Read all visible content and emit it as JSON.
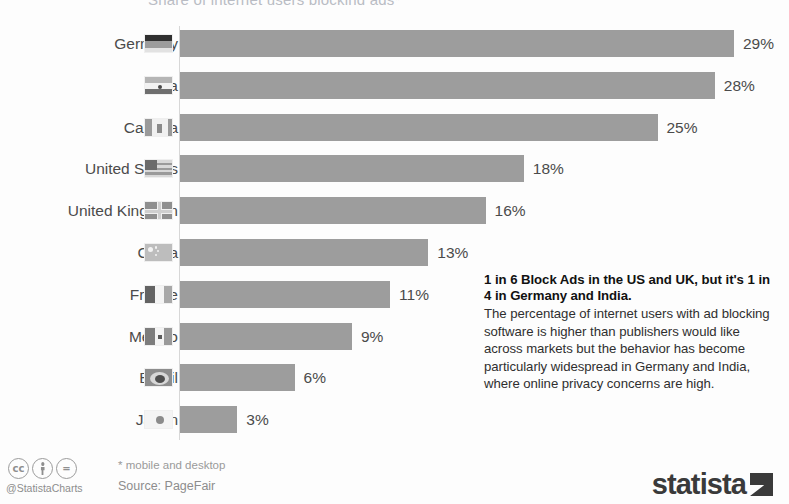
{
  "title_clipped": "Share of internet users blocking ads*",
  "chart_data": {
    "type": "bar",
    "orientation": "horizontal",
    "title": "Share of internet users blocking ads*",
    "xlabel": "",
    "ylabel": "",
    "xlim": [
      0,
      29
    ],
    "grid": false,
    "legend": "none",
    "value_suffix": "%",
    "bar_color": "#9d9d9d",
    "categories": [
      "Germany",
      "India",
      "Canada",
      "United States",
      "United Kingdom",
      "China",
      "France",
      "Mexico",
      "Brazil",
      "Japan"
    ],
    "values": [
      29,
      28,
      25,
      18,
      16,
      13,
      11,
      9,
      6,
      3
    ],
    "labels": [
      "29%",
      "28%",
      "25%",
      "18%",
      "16%",
      "13%",
      "11%",
      "9%",
      "6%",
      "3%"
    ]
  },
  "rows": [
    {
      "country": "Germany",
      "value": 29,
      "label": "29%",
      "flag": "flag-de"
    },
    {
      "country": "India",
      "value": 28,
      "label": "28%",
      "flag": "flag-in"
    },
    {
      "country": "Canada",
      "value": 25,
      "label": "25%",
      "flag": "flag-ca"
    },
    {
      "country": "United States",
      "value": 18,
      "label": "18%",
      "flag": "flag-us"
    },
    {
      "country": "United Kingdom",
      "value": 16,
      "label": "16%",
      "flag": "flag-gb"
    },
    {
      "country": "China",
      "value": 13,
      "label": "13%",
      "flag": "flag-cn"
    },
    {
      "country": "France",
      "value": 11,
      "label": "11%",
      "flag": "flag-fr"
    },
    {
      "country": "Mexico",
      "value": 9,
      "label": "9%",
      "flag": "flag-mx"
    },
    {
      "country": "Brazil",
      "value": 6,
      "label": "6%",
      "flag": "flag-br"
    },
    {
      "country": "Japan",
      "value": 3,
      "label": "3%",
      "flag": "flag-jp"
    }
  ],
  "annotation": {
    "headline": "1 in 6 Block Ads in the US and UK, but it's 1 in 4 in Germany and India.",
    "body": "The percentage of internet users with ad blocking software is higher than publishers would like across markets but the behavior has become particularly widespread in Germany and India, where online privacy concerns are high."
  },
  "footer": {
    "cc_label": "cc",
    "by_label": "",
    "nd_label": "=",
    "handle": "@StatistaCharts",
    "note": "* mobile and desktop",
    "source": "Source: PageFair",
    "logo_text": "statista"
  }
}
